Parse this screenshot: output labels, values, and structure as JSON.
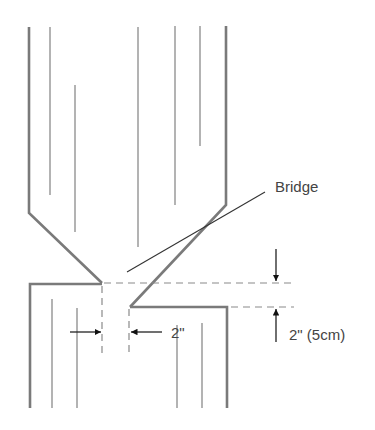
{
  "diagram": {
    "title_label": "Bridge",
    "horizontal_dimension": "2\"",
    "vertical_dimension": "2\" (5cm)",
    "colors": {
      "outline": "#7a7a7a",
      "grain": "#8a8a8a",
      "arrows": "#222222",
      "text": "#444444",
      "background": "#ffffff"
    },
    "upper_piece": {
      "outline_points": [
        [
          29,
          27
        ],
        [
          29,
          213
        ],
        [
          102,
          283
        ]
      ],
      "outline_right_points": [
        [
          226,
          26
        ],
        [
          226,
          205
        ],
        [
          130,
          307
        ]
      ],
      "grain_lines": [
        {
          "x": 50,
          "y1": 27,
          "y2": 195
        },
        {
          "x": 75,
          "y1": 85,
          "y2": 232
        },
        {
          "x": 138,
          "y1": 27,
          "y2": 247
        },
        {
          "x": 175,
          "y1": 26,
          "y2": 205
        },
        {
          "x": 200,
          "y1": 26,
          "y2": 146
        }
      ]
    },
    "lower_left_piece": {
      "outline_points": [
        [
          30,
          408
        ],
        [
          30,
          284
        ],
        [
          102,
          284
        ]
      ],
      "grain_lines": [
        {
          "x": 52,
          "y1": 299,
          "y2": 408
        },
        {
          "x": 77,
          "y1": 308,
          "y2": 408
        }
      ]
    },
    "lower_right_piece": {
      "outline_points": [
        [
          130,
          307
        ],
        [
          227,
          307
        ],
        [
          227,
          408
        ]
      ],
      "grain_lines": [
        {
          "x": 177,
          "y1": 325,
          "y2": 408
        },
        {
          "x": 202,
          "y1": 323,
          "y2": 408
        }
      ]
    }
  }
}
